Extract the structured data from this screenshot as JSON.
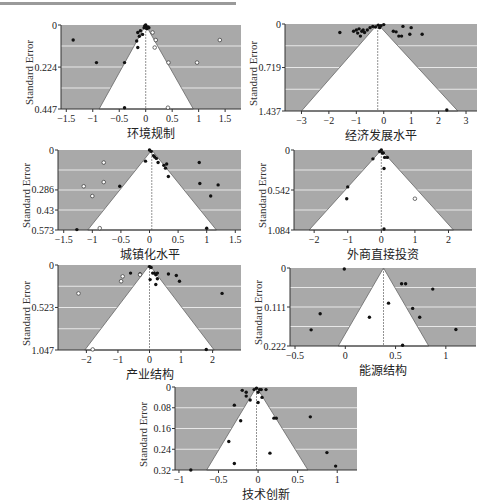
{
  "chart_data": [
    {
      "type": "scatter",
      "subtype": "funnel",
      "title": "",
      "xlabel": "环境规制",
      "ylabel": "Standard Error",
      "xlim": [
        -1.6,
        1.8
      ],
      "ylim": [
        0,
        0.447
      ],
      "xticks": [
        -1.5,
        -1,
        -0.5,
        0,
        0.5,
        1,
        1.5
      ],
      "yticks": [
        0,
        0.224,
        0.447
      ],
      "center": 0,
      "funnel_base": [
        -0.88,
        0.9
      ],
      "points_filled": [
        [
          -1.37,
          0.08
        ],
        [
          -0.93,
          0.2
        ],
        [
          -0.4,
          0.2
        ],
        [
          -0.4,
          0.44
        ],
        [
          -0.17,
          0.085
        ],
        [
          -0.15,
          0.12
        ],
        [
          -0.15,
          0.04
        ],
        [
          -0.12,
          0.06
        ],
        [
          -0.1,
          0.03
        ],
        [
          -0.06,
          0.05
        ],
        [
          -0.02,
          0.005
        ],
        [
          0,
          0
        ],
        [
          0.01,
          0.01
        ],
        [
          0.02,
          0.02
        ],
        [
          0.04,
          0.01
        ],
        [
          0.06,
          0.015
        ],
        [
          -0.03,
          0.015
        ]
      ],
      "points_hollow": [
        [
          0.13,
          0.04
        ],
        [
          0.19,
          0.08
        ],
        [
          0.17,
          0.12
        ],
        [
          0.43,
          0.2
        ],
        [
          0.97,
          0.2
        ],
        [
          1.4,
          0.08
        ],
        [
          0.42,
          0.44
        ]
      ]
    },
    {
      "type": "scatter",
      "subtype": "funnel",
      "xlabel": "经济发展水平",
      "ylabel": "Standard Error",
      "xlim": [
        -3.6,
        3.4
      ],
      "ylim": [
        0,
        1.437
      ],
      "xticks": [
        -3,
        -2,
        -1,
        0,
        1,
        2,
        3
      ],
      "yticks": [
        0,
        0.719,
        1.437
      ],
      "center": -0.22,
      "funnel_base": [
        -3.0,
        2.7
      ],
      "points_filled": [
        [
          -1.6,
          0.14
        ],
        [
          -1.1,
          0.12
        ],
        [
          -1.0,
          0.1
        ],
        [
          -0.95,
          0.15
        ],
        [
          -0.9,
          0.08
        ],
        [
          -0.85,
          0.2
        ],
        [
          -0.8,
          0.12
        ],
        [
          -0.75,
          0.1
        ],
        [
          -0.7,
          0.14
        ],
        [
          -0.6,
          0.1
        ],
        [
          -0.5,
          0.06
        ],
        [
          -0.4,
          0.04
        ],
        [
          -0.3,
          0.05
        ],
        [
          -0.2,
          0.02
        ],
        [
          -0.15,
          0.06
        ],
        [
          -0.1,
          0.03
        ],
        [
          0.0,
          0.01
        ],
        [
          0.35,
          0.12
        ],
        [
          0.45,
          0.13
        ],
        [
          0.55,
          0.2
        ],
        [
          0.65,
          0.2
        ],
        [
          0.7,
          0.04
        ],
        [
          0.95,
          0.17
        ],
        [
          1.0,
          0.06
        ],
        [
          1.4,
          0.17
        ],
        [
          2.3,
          1.42
        ]
      ],
      "points_hollow": []
    },
    {
      "type": "scatter",
      "subtype": "funnel",
      "xlabel": "城镇化水平",
      "ylabel": "Standard Error",
      "xlim": [
        -1.6,
        1.6
      ],
      "ylim": [
        0,
        0.573
      ],
      "xticks": [
        -1.5,
        -1,
        -0.5,
        0,
        0.5,
        1,
        1.5
      ],
      "yticks": [
        0,
        0.286,
        0.43,
        0.573
      ],
      "center": 0.04,
      "funnel_base": [
        -1.08,
        1.17
      ],
      "points_filled": [
        [
          -1.27,
          0.57
        ],
        [
          -0.52,
          0.26
        ],
        [
          -0.07,
          0.08
        ],
        [
          0,
          0
        ],
        [
          0.03,
          0.01
        ],
        [
          0.07,
          0.04
        ],
        [
          0.09,
          0.05
        ],
        [
          0.12,
          0.06
        ],
        [
          0.15,
          0.09
        ],
        [
          0.25,
          0.11
        ],
        [
          0.28,
          0.13
        ],
        [
          0.3,
          0.1
        ],
        [
          0.33,
          0.19
        ],
        [
          0.87,
          0.09
        ],
        [
          0.88,
          0.24
        ],
        [
          1.0,
          0.56
        ],
        [
          1.07,
          0.33
        ],
        [
          1.2,
          0.25
        ]
      ],
      "points_hollow": [
        [
          -0.8,
          0.09
        ],
        [
          -0.8,
          0.23
        ],
        [
          -1.15,
          0.26
        ],
        [
          -1.0,
          0.33
        ],
        [
          -0.87,
          0.56
        ]
      ]
    },
    {
      "type": "scatter",
      "subtype": "funnel",
      "xlabel": "外商直接投资",
      "ylabel": "Standard Error",
      "xlim": [
        -2.6,
        2.7
      ],
      "ylim": [
        0,
        1.084
      ],
      "xticks": [
        -2,
        -1,
        0,
        1,
        2
      ],
      "yticks": [
        0,
        0.542,
        1.084
      ],
      "center": 0,
      "funnel_base": [
        -2.15,
        2.15
      ],
      "points_filled": [
        [
          -0.25,
          0.12
        ],
        [
          -0.05,
          0.02
        ],
        [
          0,
          0
        ],
        [
          0.03,
          0.04
        ],
        [
          0.06,
          0.04
        ],
        [
          0.1,
          0.1
        ],
        [
          0.18,
          0.1
        ],
        [
          0.08,
          0.25
        ],
        [
          -1.0,
          0.5
        ],
        [
          -1.03,
          0.66
        ],
        [
          0.08,
          1.07
        ]
      ],
      "points_hollow": [
        [
          1.0,
          0.66
        ]
      ]
    },
    {
      "type": "scatter",
      "subtype": "funnel",
      "xlabel": "产业结构",
      "ylabel": "Standard Error",
      "xlim": [
        -2.9,
        2.9
      ],
      "ylim": [
        0,
        1.047
      ],
      "xticks": [
        -2,
        -1,
        0,
        1,
        2
      ],
      "yticks": [
        0,
        0.523,
        1.047
      ],
      "center": 0,
      "funnel_base": [
        -2.05,
        2.05
      ],
      "points_filled": [
        [
          -0.6,
          0.1
        ],
        [
          -0.3,
          0.11
        ],
        [
          0,
          0.02
        ],
        [
          0.05,
          0.03
        ],
        [
          0.1,
          0.1
        ],
        [
          0.15,
          0.1
        ],
        [
          0.2,
          0.12
        ],
        [
          0.25,
          0.1
        ],
        [
          0.02,
          0.18
        ],
        [
          0.25,
          0.17
        ],
        [
          0.2,
          0.24
        ],
        [
          0.6,
          0.11
        ],
        [
          0.85,
          0.13
        ],
        [
          0.95,
          0.2
        ],
        [
          2.3,
          0.35
        ],
        [
          1.8,
          1.04
        ]
      ],
      "points_hollow": [
        [
          -0.85,
          0.14
        ],
        [
          -0.9,
          0.2
        ],
        [
          -2.25,
          0.35
        ],
        [
          -0.3,
          0.12
        ],
        [
          -1.8,
          1.04
        ]
      ]
    },
    {
      "type": "scatter",
      "subtype": "funnel",
      "xlabel": "能源结构",
      "ylabel": "Standard Error",
      "xlim": [
        -0.55,
        1.3
      ],
      "ylim": [
        0,
        0.222
      ],
      "xticks": [
        -0.5,
        0,
        0.5,
        1
      ],
      "yticks": [
        0,
        0.111,
        0.222
      ],
      "center": 0.38,
      "funnel_base": [
        -0.07,
        0.83
      ],
      "points_filled": [
        [
          -0.01,
          0.003
        ],
        [
          0.56,
          0.045
        ],
        [
          0.6,
          0.045
        ],
        [
          0.87,
          0.06
        ],
        [
          0.43,
          0.1
        ],
        [
          0.67,
          0.115
        ],
        [
          -0.25,
          0.13
        ],
        [
          0.24,
          0.14
        ],
        [
          0.74,
          0.14
        ],
        [
          -0.34,
          0.176
        ],
        [
          1.1,
          0.175
        ],
        [
          0.57,
          0.22
        ]
      ],
      "points_hollow": []
    },
    {
      "type": "scatter",
      "subtype": "funnel",
      "xlabel": "技术创新",
      "ylabel": "Standard Error",
      "xlim": [
        -1.05,
        1.25
      ],
      "ylim": [
        0,
        0.32
      ],
      "xticks": [
        -1,
        -0.5,
        0,
        0.5,
        1
      ],
      "yticks": [
        0,
        0.08,
        0.16,
        0.24,
        0.32
      ],
      "center": -0.02,
      "funnel_base": [
        -0.65,
        0.63
      ],
      "points_filled": [
        [
          -0.2,
          0.013
        ],
        [
          -0.15,
          0.02
        ],
        [
          -0.15,
          0.035
        ],
        [
          -0.1,
          0.05
        ],
        [
          -0.05,
          0.01
        ],
        [
          -0.02,
          0.005
        ],
        [
          0.0,
          0.02
        ],
        [
          0.02,
          0.01
        ],
        [
          0.04,
          0.01
        ],
        [
          0.1,
          0.01
        ],
        [
          0.05,
          0.04
        ],
        [
          0.0,
          0.06
        ],
        [
          -0.3,
          0.07
        ],
        [
          -0.22,
          0.13
        ],
        [
          0.2,
          0.12
        ],
        [
          0.23,
          0.12
        ],
        [
          0.66,
          0.115
        ],
        [
          -0.37,
          0.21
        ],
        [
          0.15,
          0.255
        ],
        [
          0.87,
          0.253
        ],
        [
          -0.3,
          0.295
        ],
        [
          0.98,
          0.305
        ],
        [
          -0.85,
          0.32
        ]
      ],
      "points_hollow": []
    }
  ],
  "layout": {
    "colors": {
      "shade": "#a9a9a9",
      "funnel": "#ffffff",
      "grid": "#e8e8e8",
      "point": "#111111",
      "axis": "#333333"
    }
  }
}
